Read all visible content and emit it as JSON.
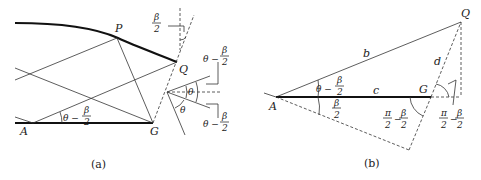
{
  "figure_a": {
    "caption": "(a)",
    "points": {
      "A": "A",
      "G": "G",
      "P": "P",
      "Q": "Q"
    },
    "angle_labels": {
      "theta_minus_half_beta_num": "β",
      "theta_minus_half_beta_den": "2",
      "theta_prefix": "θ −",
      "theta": "θ",
      "half_beta_num": "β",
      "half_beta_den": "2"
    }
  },
  "figure_b": {
    "caption": "(b)",
    "points": {
      "A": "A",
      "G": "G",
      "Q": "Q"
    },
    "sides": {
      "b": "b",
      "c": "c",
      "d": "d"
    },
    "angle_labels": {
      "theta_prefix": "θ −",
      "beta": "β",
      "two": "2",
      "pi": "π",
      "minus": "−"
    }
  }
}
